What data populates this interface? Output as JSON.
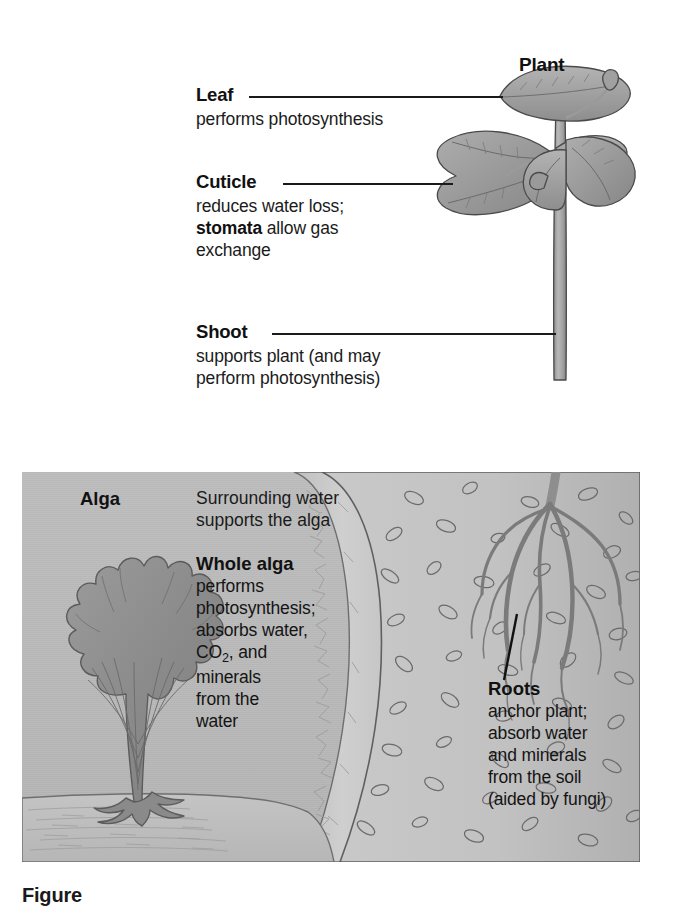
{
  "figure": {
    "plant_title": "Plant",
    "callouts": [
      {
        "heading": "Leaf",
        "body_html": "performs photosynthesis"
      },
      {
        "heading": "Cuticle",
        "body_html": "reduces water loss;<br><b>stomata</b> allow gas<br>exchange"
      },
      {
        "heading": "Shoot",
        "body_html": "supports plant (and may<br>perform photosynthesis)"
      }
    ],
    "panel": {
      "alga_title": "Alga",
      "water_note": "Surrounding water<br>supports the alga",
      "alga_caption": {
        "heading": "Whole alga",
        "body_html": "performs<br>photosynthesis;<br>absorbs water,<br>CO<sub>2</sub>, and<br>minerals<br>from the<br>water"
      },
      "roots_caption": {
        "heading": "Roots",
        "body_html": "anchor plant;<br>absorb water<br>and minerals<br>from the soil<br>(aided by fungi)"
      }
    },
    "caption_partial": "Figure",
    "colors": {
      "ink": "#1a1a1a",
      "water": "#bdbdbd",
      "soil": "#c3c3c3",
      "bank": "#cbcbcb",
      "plant_green": "#9d9d9d",
      "alga": "#8f8f8f",
      "sand": "#bfbfbf"
    }
  }
}
